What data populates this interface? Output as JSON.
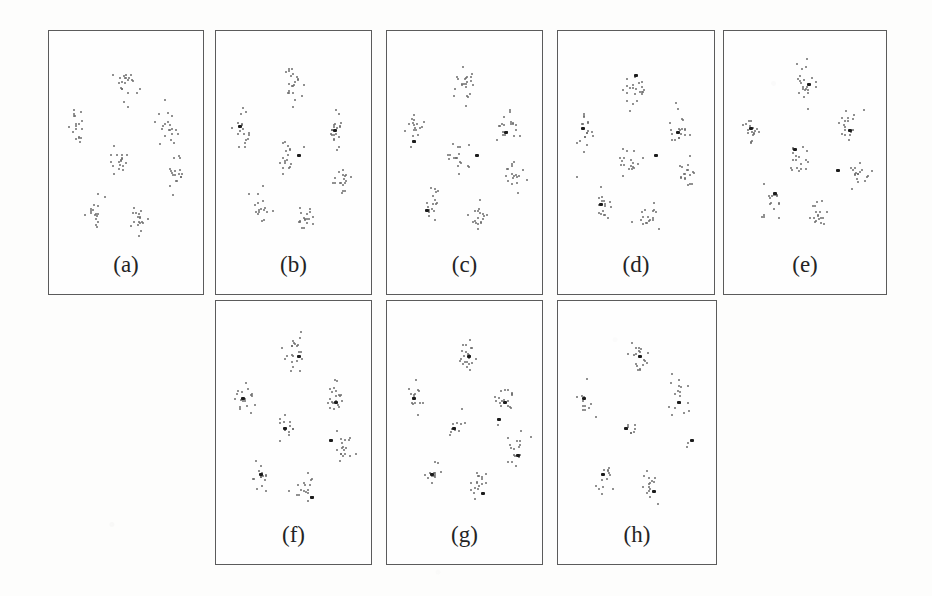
{
  "figure": {
    "background_color": "#fdfdfc",
    "point_color": "#6d6d6d",
    "prototype_color": "#1c1c1c",
    "border_color": "#5b5b5b",
    "panel_count": 8
  },
  "chart_data": {
    "type": "scatter",
    "title": "",
    "subtitle": "",
    "xlabel": "",
    "ylabel": "",
    "xlim": [
      0,
      100
    ],
    "ylim": [
      0,
      100
    ],
    "grid": false,
    "legend": "none",
    "note": "Eight-panel scatter sequence; each panel shows the same seven Gaussian point clusters with progressively more bold prototype/centroid markers overlaid.",
    "cluster_centers": [
      {
        "name": "top-center",
        "x": 50,
        "y": 82
      },
      {
        "name": "left",
        "x": 14,
        "y": 60
      },
      {
        "name": "right",
        "x": 80,
        "y": 60
      },
      {
        "name": "center",
        "x": 45,
        "y": 44
      },
      {
        "name": "right-lower",
        "x": 86,
        "y": 35
      },
      {
        "name": "bottom-left",
        "x": 27,
        "y": 19
      },
      {
        "name": "bottom-center",
        "x": 58,
        "y": 13
      }
    ],
    "panels": [
      {
        "label": "(a)",
        "row": 1,
        "prototypes": [],
        "outliers": [],
        "clusters": [
          {
            "center": [
              50,
              82
            ],
            "n": 22,
            "spread": [
              7,
              9
            ]
          },
          {
            "center": [
              14,
              60
            ],
            "n": 18,
            "spread": [
              6,
              9
            ]
          },
          {
            "center": [
              80,
              60
            ],
            "n": 20,
            "spread": [
              7,
              9
            ]
          },
          {
            "center": [
              45,
              44
            ],
            "n": 18,
            "spread": [
              7,
              8
            ]
          },
          {
            "center": [
              86,
              35
            ],
            "n": 18,
            "spread": [
              6,
              8
            ]
          },
          {
            "center": [
              27,
              19
            ],
            "n": 17,
            "spread": [
              6,
              8
            ]
          },
          {
            "center": [
              58,
              13
            ],
            "n": 18,
            "spread": [
              7,
              7
            ]
          }
        ]
      },
      {
        "label": "(b)",
        "row": 1,
        "prototypes": [
          [
            10,
            61
          ],
          [
            79,
            59
          ],
          [
            53,
            46
          ]
        ],
        "outliers": [],
        "clusters": [
          {
            "center": [
              50,
              82
            ],
            "n": 22,
            "spread": [
              7,
              9
            ]
          },
          {
            "center": [
              14,
              60
            ],
            "n": 18,
            "spread": [
              6,
              9
            ]
          },
          {
            "center": [
              80,
              60
            ],
            "n": 20,
            "spread": [
              7,
              9
            ]
          },
          {
            "center": [
              45,
              44
            ],
            "n": 18,
            "spread": [
              7,
              8
            ]
          },
          {
            "center": [
              86,
              35
            ],
            "n": 18,
            "spread": [
              6,
              8
            ]
          },
          {
            "center": [
              27,
              19
            ],
            "n": 17,
            "spread": [
              6,
              8
            ]
          },
          {
            "center": [
              58,
              13
            ],
            "n": 18,
            "spread": [
              7,
              7
            ]
          }
        ]
      },
      {
        "label": "(c)",
        "row": 1,
        "prototypes": [
          [
            12,
            53
          ],
          [
            79,
            58
          ],
          [
            58,
            46
          ],
          [
            22,
            17
          ]
        ],
        "outliers": [],
        "clusters": [
          {
            "center": [
              50,
              82
            ],
            "n": 22,
            "spread": [
              7,
              9
            ]
          },
          {
            "center": [
              14,
              60
            ],
            "n": 18,
            "spread": [
              6,
              9
            ]
          },
          {
            "center": [
              80,
              60
            ],
            "n": 20,
            "spread": [
              7,
              9
            ]
          },
          {
            "center": [
              45,
              44
            ],
            "n": 18,
            "spread": [
              7,
              8
            ]
          },
          {
            "center": [
              86,
              35
            ],
            "n": 18,
            "spread": [
              6,
              8
            ]
          },
          {
            "center": [
              27,
              19
            ],
            "n": 17,
            "spread": [
              6,
              8
            ]
          },
          {
            "center": [
              58,
              13
            ],
            "n": 18,
            "spread": [
              7,
              7
            ]
          }
        ]
      },
      {
        "label": "(d)",
        "row": 1,
        "prototypes": [
          [
            49,
            88
          ],
          [
            11,
            60
          ],
          [
            79,
            58
          ],
          [
            63,
            46
          ],
          [
            24,
            20
          ]
        ],
        "outliers": [
          [
            7,
            34
          ]
        ],
        "clusters": [
          {
            "center": [
              50,
              82
            ],
            "n": 22,
            "spread": [
              7,
              9
            ]
          },
          {
            "center": [
              14,
              60
            ],
            "n": 18,
            "spread": [
              6,
              9
            ]
          },
          {
            "center": [
              80,
              60
            ],
            "n": 20,
            "spread": [
              7,
              9
            ]
          },
          {
            "center": [
              45,
              44
            ],
            "n": 18,
            "spread": [
              7,
              8
            ]
          },
          {
            "center": [
              86,
              35
            ],
            "n": 18,
            "spread": [
              6,
              8
            ]
          },
          {
            "center": [
              27,
              19
            ],
            "n": 17,
            "spread": [
              6,
              8
            ]
          },
          {
            "center": [
              58,
              13
            ],
            "n": 18,
            "spread": [
              7,
              7
            ]
          }
        ]
      },
      {
        "label": "(e)",
        "row": 1,
        "prototypes": [
          [
            52,
            83
          ],
          [
            12,
            60
          ],
          [
            80,
            59
          ],
          [
            42,
            49
          ],
          [
            72,
            38
          ],
          [
            28,
            26
          ]
        ],
        "outliers": [],
        "clusters": [
          {
            "center": [
              50,
              82
            ],
            "n": 22,
            "spread": [
              7,
              9
            ]
          },
          {
            "center": [
              14,
              60
            ],
            "n": 18,
            "spread": [
              6,
              9
            ]
          },
          {
            "center": [
              80,
              60
            ],
            "n": 20,
            "spread": [
              7,
              9
            ]
          },
          {
            "center": [
              45,
              44
            ],
            "n": 18,
            "spread": [
              7,
              8
            ]
          },
          {
            "center": [
              86,
              35
            ],
            "n": 18,
            "spread": [
              6,
              8
            ]
          },
          {
            "center": [
              27,
              19
            ],
            "n": 17,
            "spread": [
              6,
              8
            ]
          },
          {
            "center": [
              58,
              13
            ],
            "n": 18,
            "spread": [
              7,
              7
            ]
          }
        ]
      },
      {
        "label": "(f)",
        "row": 2,
        "prototypes": [
          [
            53,
            82
          ],
          [
            12,
            60
          ],
          [
            80,
            58
          ],
          [
            43,
            44
          ],
          [
            76,
            38
          ],
          [
            25,
            20
          ],
          [
            62,
            8
          ]
        ],
        "outliers": [],
        "clusters": [
          {
            "center": [
              50,
              82
            ],
            "n": 22,
            "spread": [
              7,
              9
            ]
          },
          {
            "center": [
              14,
              60
            ],
            "n": 18,
            "spread": [
              6,
              9
            ]
          },
          {
            "center": [
              80,
              60
            ],
            "n": 20,
            "spread": [
              7,
              9
            ]
          },
          {
            "center": [
              45,
              44
            ],
            "n": 13,
            "spread": [
              6,
              7
            ]
          },
          {
            "center": [
              86,
              35
            ],
            "n": 18,
            "spread": [
              6,
              8
            ]
          },
          {
            "center": [
              27,
              19
            ],
            "n": 15,
            "spread": [
              6,
              7
            ]
          },
          {
            "center": [
              58,
              13
            ],
            "n": 18,
            "spread": [
              7,
              7
            ]
          }
        ]
      },
      {
        "label": "(g)",
        "row": 2,
        "prototypes": [
          [
            52,
            82
          ],
          [
            12,
            60
          ],
          [
            78,
            58
          ],
          [
            74,
            49
          ],
          [
            41,
            44
          ],
          [
            88,
            30
          ],
          [
            25,
            20
          ],
          [
            62,
            10
          ]
        ],
        "outliers": [],
        "clusters": [
          {
            "center": [
              50,
              82
            ],
            "n": 22,
            "spread": [
              7,
              9
            ]
          },
          {
            "center": [
              14,
              60
            ],
            "n": 15,
            "spread": [
              6,
              8
            ]
          },
          {
            "center": [
              80,
              60
            ],
            "n": 18,
            "spread": [
              7,
              9
            ]
          },
          {
            "center": [
              45,
              44
            ],
            "n": 10,
            "spread": [
              5,
              6
            ]
          },
          {
            "center": [
              86,
              35
            ],
            "n": 17,
            "spread": [
              6,
              8
            ]
          },
          {
            "center": [
              27,
              19
            ],
            "n": 13,
            "spread": [
              6,
              7
            ]
          },
          {
            "center": [
              58,
              13
            ],
            "n": 17,
            "spread": [
              7,
              7
            ]
          }
        ]
      },
      {
        "label": "(h)",
        "row": 2,
        "prototypes": [
          [
            51,
            82
          ],
          [
            11,
            60
          ],
          [
            79,
            58
          ],
          [
            41,
            44
          ],
          [
            88,
            38
          ],
          [
            25,
            20
          ],
          [
            61,
            11
          ]
        ],
        "outliers": [],
        "clusters": [
          {
            "center": [
              50,
              82
            ],
            "n": 19,
            "spread": [
              7,
              9
            ]
          },
          {
            "center": [
              14,
              60
            ],
            "n": 13,
            "spread": [
              6,
              8
            ]
          },
          {
            "center": [
              80,
              60
            ],
            "n": 17,
            "spread": [
              7,
              9
            ]
          },
          {
            "center": [
              45,
              44
            ],
            "n": 8,
            "spread": [
              5,
              5
            ]
          },
          {
            "center": [
              86,
              35
            ],
            "n": 2,
            "spread": [
              2,
              2
            ]
          },
          {
            "center": [
              27,
              19
            ],
            "n": 13,
            "spread": [
              6,
              7
            ]
          },
          {
            "center": [
              58,
              13
            ],
            "n": 15,
            "spread": [
              6,
              7
            ]
          }
        ]
      }
    ]
  },
  "layout": {
    "row1": {
      "top": 30,
      "height": 265,
      "panel_width": 156,
      "x_positions": [
        48,
        215,
        386,
        557,
        723
      ],
      "panel_widths": [
        156,
        157,
        157,
        158,
        164
      ]
    },
    "row2": {
      "top": 300,
      "height": 265,
      "panel_width": 157,
      "x_positions": [
        215,
        386,
        557
      ],
      "panel_widths": [
        157,
        157,
        160
      ]
    },
    "label_offset_from_bottom": 58
  }
}
